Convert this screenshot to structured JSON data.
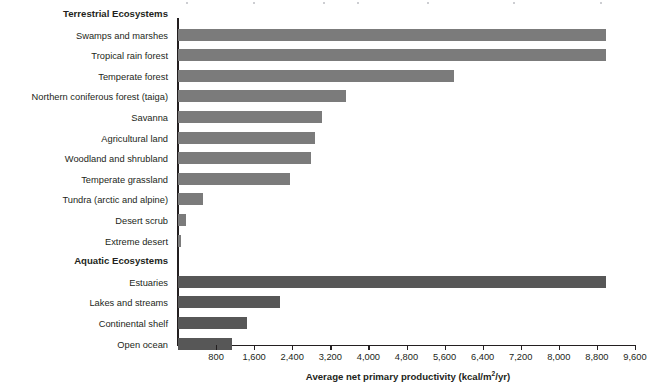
{
  "figure": {
    "axis_title_main": "Average net primary productivity (kcal/m",
    "axis_title_sup": "2",
    "axis_title_tail": "/yr)",
    "bar_color_terrestrial": "#7b7b7b",
    "bar_color_aquatic": "#575757",
    "axis_color": "#231f20"
  },
  "chart_data": {
    "type": "bar",
    "orientation": "horizontal",
    "title": "",
    "xlabel": "Average net primary productivity (kcal/m2/yr)",
    "ylabel": "",
    "xlim": [
      0,
      9600
    ],
    "grid": false,
    "legend": "none",
    "tick_labels": [
      "800",
      "1,600",
      "2,400",
      "3,200",
      "4,000",
      "4,800",
      "5,600",
      "6,400",
      "7,200",
      "8,000",
      "8,800",
      "9,600"
    ],
    "ticks": [
      800,
      1600,
      2400,
      3200,
      4000,
      4800,
      5600,
      6400,
      7200,
      8000,
      8800,
      9600
    ],
    "groups": [
      {
        "name": "Terrestrial Ecosystems",
        "color": "#7b7b7b",
        "categories": [
          "Swamps and marshes",
          "Tropical rain forest",
          "Temperate forest",
          "Northern coniferous forest (taiga)",
          "Savanna",
          "Agricultural land",
          "Woodland and shrubland",
          "Temperate grassland",
          "Tundra (arctic and alpine)",
          "Desert scrub",
          "Extreme desert"
        ],
        "values": [
          9000,
          9000,
          5800,
          3530,
          3030,
          2880,
          2800,
          2350,
          530,
          170,
          60
        ]
      },
      {
        "name": "Aquatic Ecosystems",
        "color": "#575757",
        "categories": [
          "Estuaries",
          "Lakes and streams",
          "Continental shelf",
          "Open ocean"
        ],
        "values": [
          9000,
          2150,
          1450,
          1130
        ]
      }
    ]
  }
}
